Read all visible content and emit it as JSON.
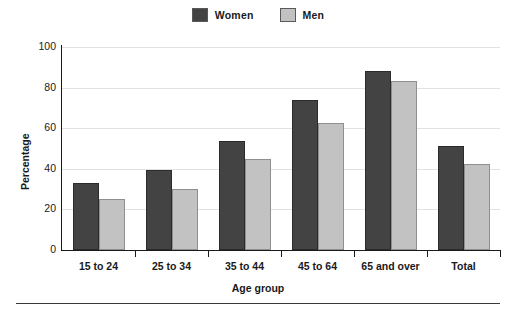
{
  "chart_data": {
    "type": "bar",
    "title": "",
    "xlabel": "Age group",
    "ylabel": "Percentage",
    "categories": [
      "15 to 24",
      "25 to 34",
      "35 to 44",
      "45 to 64",
      "65 and over",
      "Total"
    ],
    "series": [
      {
        "name": "Women",
        "color": "#434343",
        "values": [
          33,
          39.5,
          53.5,
          74,
          88,
          51
        ]
      },
      {
        "name": "Men",
        "color": "#c2c2c2",
        "values": [
          25,
          30,
          45,
          62.5,
          83.5,
          42.5
        ]
      }
    ],
    "ylim": [
      0,
      100
    ],
    "yticks": [
      0,
      20,
      40,
      60,
      80,
      100
    ],
    "ytick_labels": [
      "0",
      "20",
      "40",
      "60",
      "80",
      "100"
    ],
    "grid": "horizontal",
    "legend_position": "top-center"
  },
  "legend": {
    "items": [
      {
        "label": "Women",
        "swatch": "#434343"
      },
      {
        "label": "Men",
        "swatch": "#c2c2c2"
      }
    ]
  },
  "axes": {
    "y_title": "Percentage",
    "x_title": "Age group"
  }
}
